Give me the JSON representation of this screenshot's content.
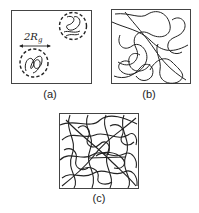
{
  "figure": {
    "panels": [
      {
        "id": "a",
        "label": "(a)",
        "description": "dilute regime: isolated coils"
      },
      {
        "id": "b",
        "label": "(b)",
        "description": "semi-dilute regime: overlapping coils"
      },
      {
        "id": "c",
        "label": "(c)",
        "description": "concentrated regime: entangled coils"
      }
    ],
    "annotation": {
      "text": "2R",
      "subscript": "g"
    },
    "colors": {
      "line": "#222222",
      "border": "#444444",
      "background": "#ffffff"
    }
  }
}
